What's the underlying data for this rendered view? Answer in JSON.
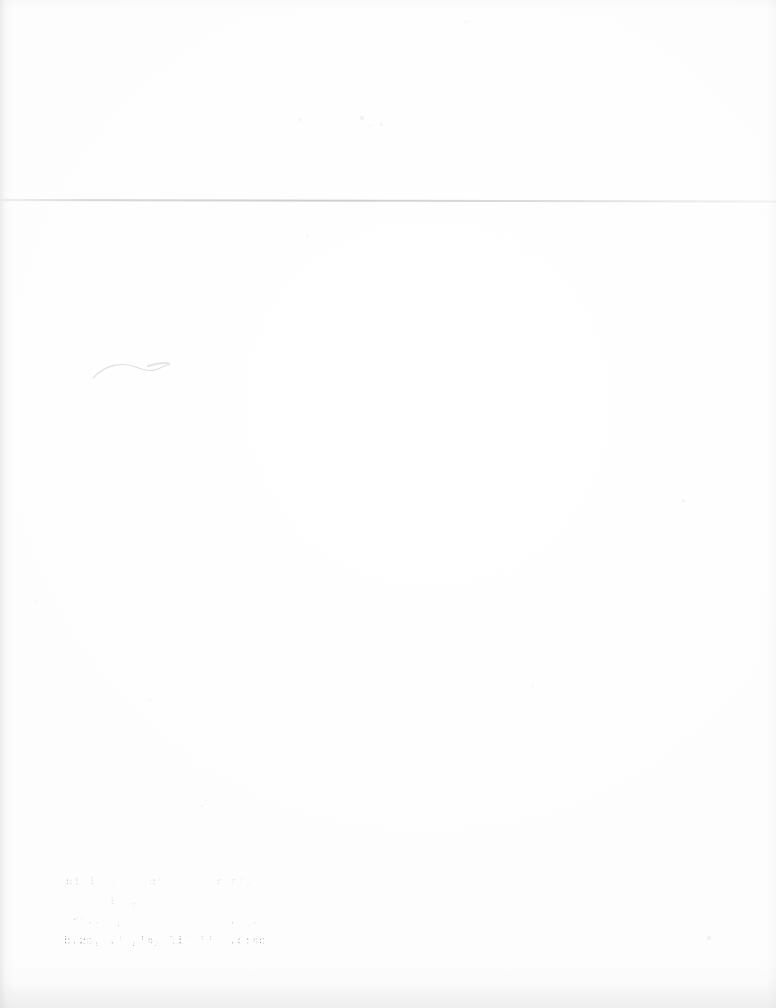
{
  "document": {
    "kind": "scanned-paper-page",
    "page_background_color": "#fefefe",
    "ink_color": "#3c3c42",
    "rule_color": "#ced0d6",
    "width_px": 776,
    "height_px": 1008
  },
  "rule": {
    "label": "horizontal-rule",
    "y_px": 199
  },
  "annotation": {
    "squiggle_label": "faint pen stroke"
  },
  "faded_text_block": {
    "label": "faded typewriter stamp",
    "legible": false,
    "line_count": 4,
    "lines": [
      "Ri l  F    R'       r n',  P:A  nT's",
      "   l  ,  .      .        o     ''a",
      "Tr:..  , .            .  .  rl'r.",
      "b,2s, .' ,'4, li' ''  .(:4e...2s'2'"
    ]
  },
  "specks": [
    {
      "x": 300,
      "y": 120,
      "r": 1.4,
      "o": 0.3
    },
    {
      "x": 362,
      "y": 118,
      "r": 1.6,
      "o": 0.34
    },
    {
      "x": 370,
      "y": 126,
      "r": 1.3,
      "o": 0.28
    },
    {
      "x": 381,
      "y": 124,
      "r": 1.5,
      "o": 0.26
    },
    {
      "x": 307,
      "y": 236,
      "r": 1.3,
      "o": 0.26
    },
    {
      "x": 466,
      "y": 22,
      "r": 1.2,
      "o": 0.22
    },
    {
      "x": 683,
      "y": 500,
      "r": 1.5,
      "o": 0.3
    },
    {
      "x": 709,
      "y": 938,
      "r": 1.6,
      "o": 0.3
    },
    {
      "x": 36,
      "y": 602,
      "r": 1.2,
      "o": 0.22
    },
    {
      "x": 202,
      "y": 806,
      "r": 1.4,
      "o": 0.34
    },
    {
      "x": 205,
      "y": 800,
      "r": 1.1,
      "o": 0.26
    },
    {
      "x": 150,
      "y": 700,
      "r": 1.1,
      "o": 0.2
    },
    {
      "x": 533,
      "y": 687,
      "r": 1.1,
      "o": 0.2
    },
    {
      "x": 487,
      "y": 408,
      "r": 1.0,
      "o": 0.18
    },
    {
      "x": 629,
      "y": 690,
      "r": 1.0,
      "o": 0.18
    },
    {
      "x": 264,
      "y": 646,
      "r": 1.0,
      "o": 0.16
    },
    {
      "x": 742,
      "y": 760,
      "r": 1.1,
      "o": 0.18
    },
    {
      "x": 96,
      "y": 456,
      "r": 1.0,
      "o": 0.16
    }
  ]
}
